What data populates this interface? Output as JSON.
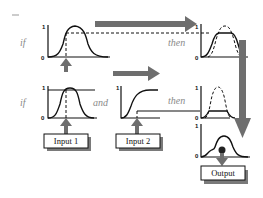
{
  "diagram": {
    "type": "fuzzy-inference-rules",
    "rule1": {
      "if_label": "if",
      "then_label": "then",
      "antecedent_axis": {
        "top": "1",
        "bottom": "0"
      },
      "consequent_axis": {
        "top": "1",
        "bottom": "0"
      }
    },
    "rule2": {
      "if_label": "if",
      "and_label": "and",
      "then_label": "then",
      "antecedent1_axis": {
        "top": "1",
        "bottom": "0"
      },
      "antecedent2_axis": {
        "top": "1"
      },
      "consequent_axis": {
        "top": "1",
        "bottom": "0"
      }
    },
    "aggregate_axis": {
      "top": "1",
      "bottom": "0"
    },
    "inputs": [
      {
        "label": "Input 1"
      },
      {
        "label": "Input 2"
      }
    ],
    "output": {
      "label": "Output"
    },
    "colors": {
      "arrow": "#6e6e6e",
      "label_text": "#8a8a8a",
      "lines": "#111111",
      "box_shadow": "#7a7a7a"
    }
  }
}
